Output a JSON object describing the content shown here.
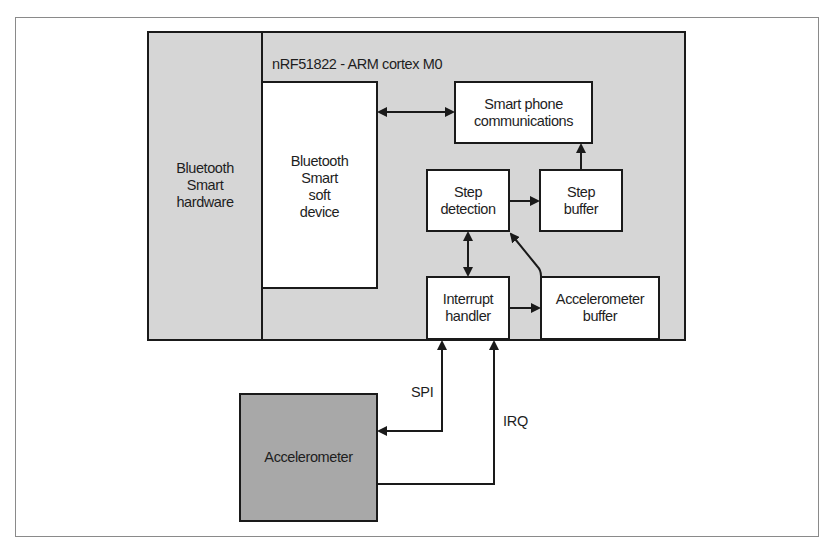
{
  "diagram": {
    "chip_title": "nRF51822 - ARM cortex M0",
    "colors": {
      "chip_fill": "#d6d6d6",
      "accelerometer_fill": "#a8a8a8",
      "block_fill": "#ffffff",
      "stroke": "#1a1a1a",
      "frame": "#8a8a8a"
    },
    "blocks": {
      "bt_hardware": {
        "lines": [
          "Bluetooth",
          "Smart",
          "hardware"
        ]
      },
      "soft_device": {
        "lines": [
          "Bluetooth",
          "Smart",
          "soft",
          "device"
        ]
      },
      "phone_comms": {
        "lines": [
          "Smart phone",
          "communications"
        ]
      },
      "step_detection": {
        "lines": [
          "Step",
          "detection"
        ]
      },
      "step_buffer": {
        "lines": [
          "Step",
          "buffer"
        ]
      },
      "interrupt_handler": {
        "lines": [
          "Interrupt",
          "handler"
        ]
      },
      "accel_buffer": {
        "lines": [
          "Accelerometer",
          "buffer"
        ]
      },
      "accelerometer": {
        "lines": [
          "Accelerometer"
        ]
      }
    },
    "signals": {
      "spi": "SPI",
      "irq": "IRQ"
    },
    "connections": [
      {
        "from": "soft_device",
        "to": "phone_comms",
        "type": "bidirectional"
      },
      {
        "from": "step_buffer",
        "to": "phone_comms",
        "type": "directed"
      },
      {
        "from": "step_detection",
        "to": "step_buffer",
        "type": "directed"
      },
      {
        "from": "step_detection",
        "to": "interrupt_handler",
        "type": "bidirectional"
      },
      {
        "from": "accel_buffer",
        "to": "step_detection",
        "type": "directed"
      },
      {
        "from": "interrupt_handler",
        "to": "accel_buffer",
        "type": "directed"
      },
      {
        "from": "accelerometer",
        "to": "interrupt_handler",
        "type": "bidirectional",
        "label": "SPI"
      },
      {
        "from": "accelerometer",
        "to": "interrupt_handler",
        "type": "directed",
        "label": "IRQ"
      }
    ]
  }
}
